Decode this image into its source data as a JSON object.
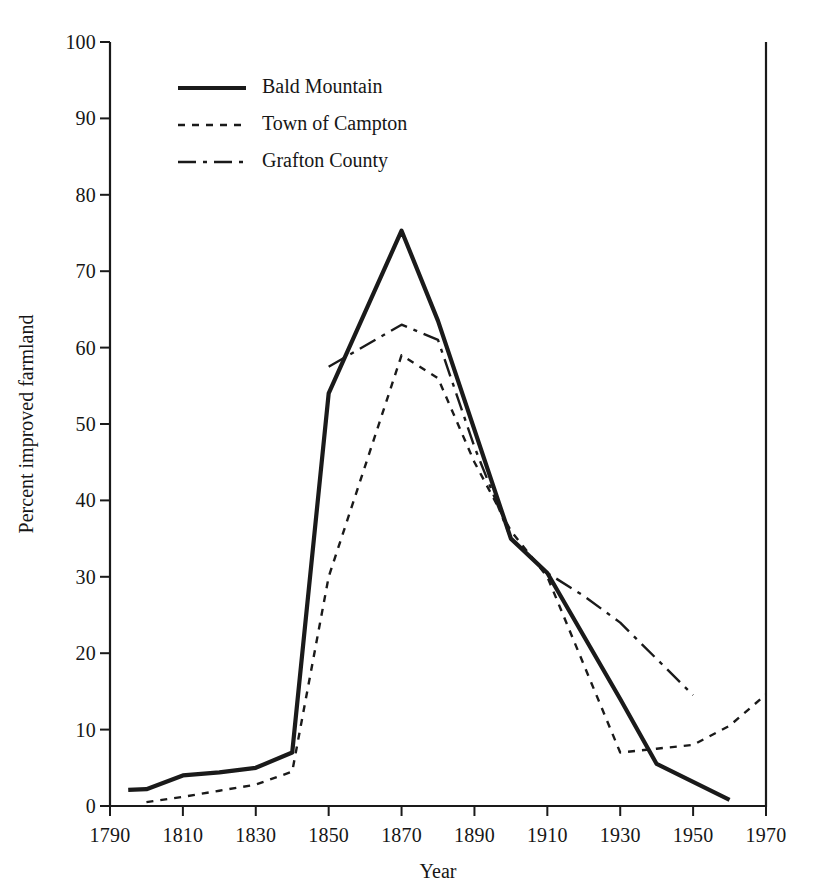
{
  "figure": {
    "background_color": "#ffffff",
    "line_color": "#1a1a1a"
  },
  "axes": {
    "x_title": "Year",
    "y_title": "Percent improved farmland",
    "x_ticks": [
      "1790",
      "1810",
      "1830",
      "1850",
      "1870",
      "1890",
      "1910",
      "1930",
      "1950",
      "1970"
    ],
    "y_ticks": [
      "0",
      "10",
      "20",
      "30",
      "40",
      "50",
      "60",
      "70",
      "80",
      "90",
      "100"
    ]
  },
  "legend": {
    "entries": [
      {
        "label": "Bald Mountain",
        "style": "solid"
      },
      {
        "label": "Town of Campton",
        "style": "dotted"
      },
      {
        "label": "Grafton County",
        "style": "dash-dot"
      }
    ]
  },
  "chart_data": {
    "type": "line",
    "title": "",
    "xlabel": "Year",
    "ylabel": "Percent improved farmland",
    "xlim": [
      1790,
      1970
    ],
    "ylim": [
      0,
      100
    ],
    "xticks": [
      1790,
      1810,
      1830,
      1850,
      1870,
      1890,
      1910,
      1930,
      1950,
      1970
    ],
    "yticks": [
      0,
      10,
      20,
      30,
      40,
      50,
      60,
      70,
      80,
      90,
      100
    ],
    "grid": false,
    "legend_position": "upper-left-inside",
    "series": [
      {
        "name": "Bald Mountain",
        "style": "solid",
        "color": "#1a1a1a",
        "x": [
          1795,
          1800,
          1810,
          1820,
          1830,
          1840,
          1850,
          1870,
          1880,
          1900,
          1910,
          1930,
          1940,
          1960
        ],
        "y": [
          2.1,
          2.2,
          4.0,
          4.4,
          5.0,
          7.0,
          54.0,
          75.3,
          63.5,
          35.0,
          30.5,
          14.0,
          5.5,
          0.8
        ]
      },
      {
        "name": "Town of Campton",
        "style": "dotted",
        "color": "#1a1a1a",
        "x": [
          1800,
          1810,
          1820,
          1830,
          1840,
          1850,
          1870,
          1880,
          1890,
          1900,
          1910,
          1930,
          1940,
          1950,
          1960,
          1970
        ],
        "y": [
          0.5,
          1.2,
          2.0,
          2.8,
          4.5,
          30.0,
          59.0,
          56.0,
          45.0,
          36.0,
          30.0,
          7.0,
          7.5,
          8.0,
          10.5,
          14.6
        ]
      },
      {
        "name": "Grafton County",
        "style": "dash-dot",
        "color": "#1a1a1a",
        "x": [
          1850,
          1870,
          1880,
          1890,
          1900,
          1910,
          1920,
          1930,
          1950
        ],
        "y": [
          57.5,
          63.0,
          61.0,
          47.0,
          35.0,
          30.5,
          27.5,
          24.0,
          14.5
        ]
      }
    ]
  }
}
